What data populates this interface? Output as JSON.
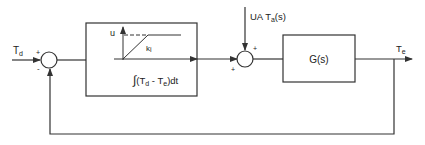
{
  "diagram": {
    "type": "control-loop-block-diagram",
    "colors": {
      "line": "#333333",
      "text": "#222222",
      "background": "#ffffff"
    },
    "input": {
      "symbol": "T",
      "subscript": "d"
    },
    "output": {
      "symbol": "T",
      "subscript": "e"
    },
    "summing_junction_1": {
      "plus_sign": "+",
      "minus_sign": "-"
    },
    "controller_block": {
      "graph": {
        "y_axis_label": "u",
        "slope_label_symbol": "k",
        "slope_label_subscript": "i",
        "x_axis_expression": {
          "integral": "∫",
          "open": "(T",
          "sub1": "d",
          "middle": " - T",
          "sub2": "e",
          "close": ")dt"
        }
      }
    },
    "disturbance_input": {
      "prefix": "UA T",
      "subscript": "a",
      "suffix": "(s)"
    },
    "summing_junction_2": {
      "top_sign": "+",
      "left_sign": "+"
    },
    "plant_block": {
      "label": "G(s)"
    }
  }
}
